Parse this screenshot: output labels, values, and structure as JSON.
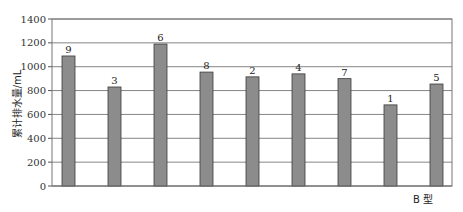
{
  "chart_data": {
    "type": "bar",
    "title": "",
    "xlabel": "B 型",
    "ylabel": "累计排水量/mL",
    "ylim": [
      0,
      1400
    ],
    "yticks": [
      0,
      200,
      400,
      600,
      800,
      1000,
      1200,
      1400
    ],
    "grid": true,
    "legend": null,
    "categories": [
      "9",
      "3",
      "6",
      "8",
      "2",
      "4",
      "7",
      "1",
      "5"
    ],
    "values": [
      1090,
      830,
      1190,
      955,
      915,
      940,
      900,
      680,
      855
    ],
    "bar_color": "#8c8c8c",
    "bar_edge_color": "#3a3a3a",
    "grid_color": "#666666"
  }
}
